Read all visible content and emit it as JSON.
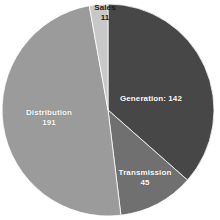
{
  "chart_data": {
    "type": "pie",
    "title": "",
    "subtitle": "",
    "xlabel": "",
    "ylabel": "",
    "legend_position": "none",
    "grid": false,
    "total": 389,
    "categories": [
      "Generation",
      "Transmission",
      "Distribution",
      "Sales"
    ],
    "values": [
      142,
      45,
      191,
      11
    ],
    "slices": [
      {
        "name": "Generation",
        "value": 142,
        "label_text": "Generation: 142",
        "label_line1": "Generation: 142",
        "label_line2": "",
        "percent": 36.5,
        "start_angle": 0,
        "sweep_angle": 131.4,
        "color": "#474747",
        "label_color": "#ffffff"
      },
      {
        "name": "Transmission",
        "value": 45,
        "label_text": "Transmission 45",
        "label_line1": "Transmission",
        "label_line2": "45",
        "percent": 11.6,
        "start_angle": 131.4,
        "sweep_angle": 41.6,
        "color": "#707070",
        "label_color": "#ffffff"
      },
      {
        "name": "Distribution",
        "value": 191,
        "label_text": "Distribution 191",
        "label_line1": "Distribution",
        "label_line2": "191",
        "percent": 49.1,
        "start_angle": 173.0,
        "sweep_angle": 176.8,
        "color": "#9b9b9b",
        "label_color": "#ffffff"
      },
      {
        "name": "Sales",
        "value": 11,
        "label_text": "Sales 11",
        "label_line1": "Sales",
        "label_line2": "11",
        "percent": 2.8,
        "start_angle": 349.8,
        "sweep_angle": 10.2,
        "color": "#c8c8c8",
        "label_color": "#1c1c1c"
      }
    ],
    "colors": {
      "background": "#ffffff",
      "generation": "#474747",
      "transmission": "#707070",
      "distribution": "#9b9b9b",
      "sales": "#c8c8c8"
    },
    "geometry": {
      "center_x": 108,
      "center_y": 110,
      "radius": 106
    }
  }
}
